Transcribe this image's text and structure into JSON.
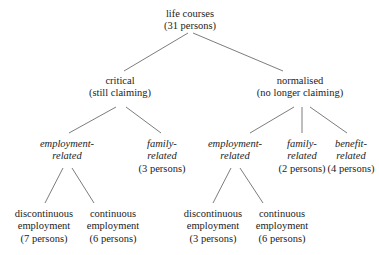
{
  "diagram": {
    "type": "tree",
    "edge_color": "#5a5a5a",
    "text_color": "#1c1c1c",
    "background": "#ffffff",
    "nodes": [
      {
        "id": "root",
        "name": "root-node-life-courses",
        "label": "life courses",
        "count": "(31 persons)",
        "italic": false,
        "x": 190,
        "y": 8
      },
      {
        "id": "critical",
        "name": "node-critical",
        "label": "critical",
        "count": "(still claiming)",
        "italic": false,
        "x": 120,
        "y": 75
      },
      {
        "id": "normalised",
        "name": "node-normalised",
        "label": "normalised",
        "count": "(no longer claiming)",
        "italic": false,
        "x": 300,
        "y": 75
      },
      {
        "id": "crit-employment",
        "name": "node-critical-employment-related",
        "label_line1": "employment-",
        "label_line2": "related",
        "count": "",
        "italic": true,
        "x": 67,
        "y": 138
      },
      {
        "id": "crit-family",
        "name": "node-critical-family-related",
        "label_line1": "family-",
        "label_line2": "related",
        "count": "(3 persons)",
        "italic": true,
        "x": 162,
        "y": 138
      },
      {
        "id": "norm-employment",
        "name": "node-normalised-employment-related",
        "label_line1": "employment-",
        "label_line2": "related",
        "count": "",
        "italic": true,
        "x": 235,
        "y": 138
      },
      {
        "id": "norm-family",
        "name": "node-normalised-family-related",
        "label_line1": "family-",
        "label_line2": "related",
        "count": "(2 persons)",
        "italic": true,
        "x": 302,
        "y": 138
      },
      {
        "id": "norm-benefit",
        "name": "node-normalised-benefit-related",
        "label_line1": "benefit-",
        "label_line2": "related",
        "count": "(4 persons)",
        "italic": true,
        "x": 351,
        "y": 138
      },
      {
        "id": "crit-discont",
        "name": "leaf-critical-discontinuous-employment",
        "label_line1": "discontinuous",
        "label_line2": "employment",
        "count": "(7 persons)",
        "italic": false,
        "x": 44,
        "y": 208
      },
      {
        "id": "crit-cont",
        "name": "leaf-critical-continuous-employment",
        "label_line1": "continuous",
        "label_line2": "employment",
        "count": "(6 persons)",
        "italic": false,
        "x": 113,
        "y": 208
      },
      {
        "id": "norm-discont",
        "name": "leaf-normalised-discontinuous-employment",
        "label_line1": "discontinuous",
        "label_line2": "employment",
        "count": "(3 persons)",
        "italic": false,
        "x": 213,
        "y": 208
      },
      {
        "id": "norm-cont",
        "name": "leaf-normalised-continuous-employment",
        "label_line1": "continuous",
        "label_line2": "employment",
        "count": "(6 persons)",
        "italic": false,
        "x": 282,
        "y": 208
      }
    ],
    "edges": [
      {
        "from": "root",
        "to": "critical",
        "x1": 188,
        "y1": 33,
        "x2": 124,
        "y2": 71
      },
      {
        "from": "root",
        "to": "normalised",
        "x1": 193,
        "y1": 33,
        "x2": 283,
        "y2": 71
      },
      {
        "from": "critical",
        "to": "crit-employment",
        "x1": 116,
        "y1": 107,
        "x2": 69,
        "y2": 133
      },
      {
        "from": "critical",
        "to": "crit-family",
        "x1": 126,
        "y1": 107,
        "x2": 161,
        "y2": 133
      },
      {
        "from": "normalised",
        "to": "norm-employment",
        "x1": 294,
        "y1": 107,
        "x2": 250,
        "y2": 133
      },
      {
        "from": "normalised",
        "to": "norm-family",
        "x1": 302,
        "y1": 107,
        "x2": 302,
        "y2": 133
      },
      {
        "from": "normalised",
        "to": "norm-benefit",
        "x1": 310,
        "y1": 107,
        "x2": 347,
        "y2": 133
      },
      {
        "from": "crit-employment",
        "to": "crit-discont",
        "x1": 63,
        "y1": 168,
        "x2": 45,
        "y2": 203
      },
      {
        "from": "crit-employment",
        "to": "crit-cont",
        "x1": 72,
        "y1": 168,
        "x2": 94,
        "y2": 203
      },
      {
        "from": "norm-employment",
        "to": "norm-discont",
        "x1": 231,
        "y1": 168,
        "x2": 213,
        "y2": 203
      },
      {
        "from": "norm-employment",
        "to": "norm-cont",
        "x1": 240,
        "y1": 168,
        "x2": 263,
        "y2": 203
      }
    ]
  }
}
